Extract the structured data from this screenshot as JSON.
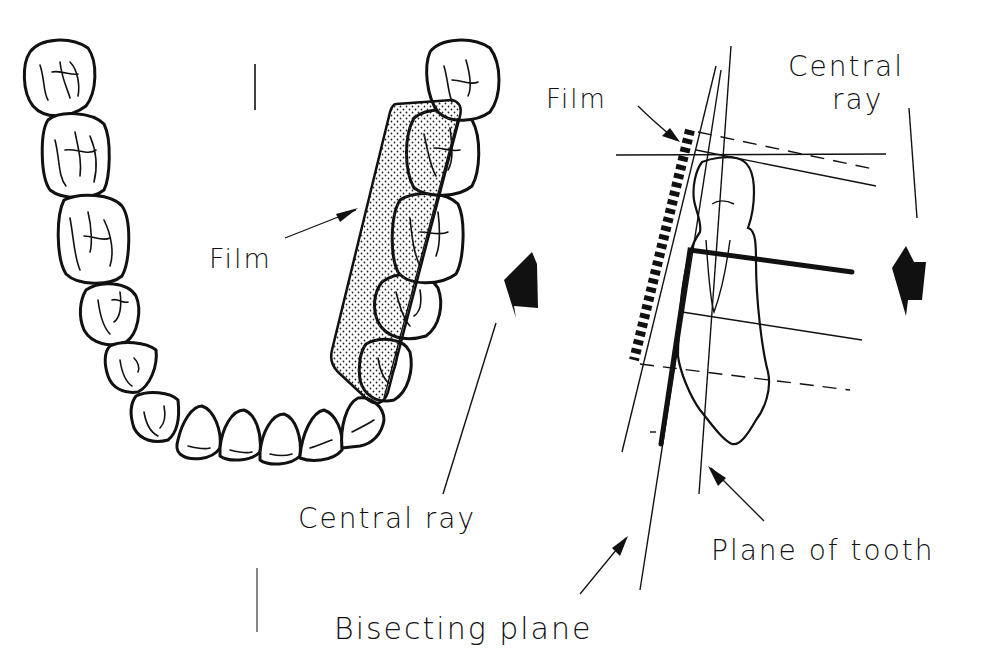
{
  "figure": {
    "left_panel": {
      "description": "Occlusal view of lower dental arch with film placed lingual to molars/premolars",
      "labels": {
        "film": "Film",
        "central_ray": "Central ray"
      }
    },
    "right_panel": {
      "description": "Lateral view of tooth, film, and bisecting plane geometry",
      "labels": {
        "film": "Film",
        "central_ray_line1": "Central",
        "central_ray_line2": "ray",
        "plane_of_tooth": "Plane of tooth",
        "bisecting_plane": "Bisecting plane"
      }
    },
    "icons": [
      "central-ray-arrow-left",
      "central-ray-arrow-right",
      "pointer-arrow"
    ],
    "colors": {
      "ink": "#111111",
      "background": "#ffffff"
    }
  }
}
